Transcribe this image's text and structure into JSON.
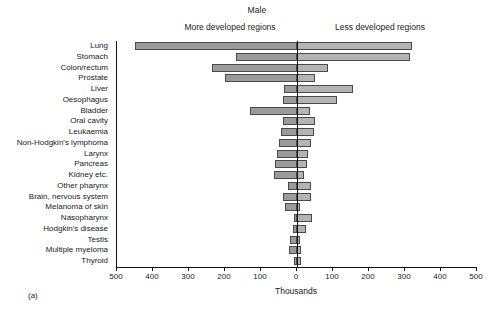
{
  "figure": {
    "panel_letter": "(a)",
    "title": "Male",
    "left_heading": "More developed regions",
    "right_heading": "Less developed regions",
    "xlabel": "Thousands"
  },
  "axis": {
    "tick_labels": [
      "500",
      "400",
      "300",
      "200",
      "100",
      "0",
      "100",
      "200",
      "300",
      "400",
      "500"
    ],
    "tick_values": [
      -500,
      -400,
      -300,
      -200,
      -100,
      0,
      100,
      200,
      300,
      400,
      500
    ]
  },
  "colors": {
    "more_developed_bar": "#9b9b9b",
    "less_developed_bar": "#b4b4b4",
    "bar_outline": "#4a4a4a",
    "axis": "#111111",
    "background": "#ffffff"
  },
  "chart_data": {
    "type": "bar",
    "title": "Male",
    "subtitle": "",
    "xlabel": "Thousands",
    "ylabel": "",
    "orientation": "horizontal",
    "layout": "diverging-population-pyramid",
    "xlim": [
      -500,
      500
    ],
    "grid": false,
    "legend_position": "top",
    "axis_note": "Left axis labels are absolute values (More developed regions extend leftward from zero)",
    "categories": [
      "Lung",
      "Stomach",
      "Colon/rectum",
      "Prostate",
      "Liver",
      "Oesophagus",
      "Bladder",
      "Oral cavity",
      "Leukaemia",
      "Non-Hodgkin's lymphoma",
      "Larynx",
      "Pancreas",
      "Kidney etc.",
      "Other pharynx",
      "Brain, nervous system",
      "Melanoma of skin",
      "Nasopharynx",
      "Hodgkin's disease",
      "Testis",
      "Multiple myeloma",
      "Thyroid"
    ],
    "series": [
      {
        "name": "More developed regions",
        "values": [
          450,
          170,
          235,
          200,
          35,
          40,
          130,
          40,
          45,
          50,
          55,
          60,
          65,
          25,
          40,
          32,
          8,
          12,
          20,
          22,
          8
        ]
      },
      {
        "name": "Less developed regions",
        "values": [
          320,
          315,
          85,
          50,
          155,
          110,
          35,
          50,
          48,
          40,
          30,
          28,
          20,
          38,
          40,
          8,
          42,
          25,
          8,
          10,
          12
        ]
      }
    ]
  }
}
